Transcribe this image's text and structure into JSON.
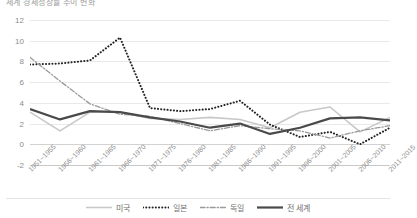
{
  "title": "세계 경제성장률 추이 변화",
  "chart_data": {
    "type": "line",
    "title": "세계 경제성장률 추이 변화",
    "xlabel": "",
    "ylabel": "",
    "ylim": [
      -2,
      12
    ],
    "yticks": [
      12,
      10,
      8,
      6,
      4,
      2,
      0,
      -2
    ],
    "grid": true,
    "legend_position": "bottom",
    "categories": [
      "1951~1955",
      "1956~1960",
      "1961~1965",
      "1966~1970",
      "1971~1975",
      "1976~1980",
      "1981~1985",
      "1986~1990",
      "1991~1995",
      "1996~2000",
      "2001~2005",
      "2006~2010",
      "2011~2015"
    ],
    "series": [
      {
        "name": "미국",
        "style": "solid-light",
        "color": "#c8c8c8",
        "values": [
          3.1,
          1.3,
          3.1,
          3.1,
          2.5,
          2.4,
          2.6,
          2.4,
          1.6,
          3.1,
          3.6,
          1.2,
          2.6
        ]
      },
      {
        "name": "일본",
        "style": "dotted",
        "color": "#222222",
        "values": [
          7.7,
          7.8,
          8.1,
          10.3,
          3.5,
          3.2,
          3.4,
          4.2,
          1.9,
          0.7,
          1.2,
          0.0,
          1.6
        ]
      },
      {
        "name": "독일",
        "style": "dash-dot",
        "color": "#9a9a9a",
        "values": [
          8.4,
          6.1,
          3.9,
          2.9,
          2.7,
          2.0,
          1.3,
          1.8,
          1.5,
          1.3,
          0.6,
          1.3,
          1.8
        ]
      },
      {
        "name": "전 세계",
        "style": "solid-dark",
        "color": "#4a4a4a",
        "values": [
          3.4,
          2.4,
          3.2,
          3.1,
          2.6,
          2.2,
          1.6,
          2.0,
          1.0,
          1.6,
          2.5,
          2.6,
          2.3
        ]
      }
    ]
  },
  "legend": [
    {
      "label": "미국",
      "key": "solid-light"
    },
    {
      "label": "일본",
      "key": "dotted"
    },
    {
      "label": "독일",
      "key": "dash-dot"
    },
    {
      "label": "전 세계",
      "key": "solid-dark"
    }
  ]
}
